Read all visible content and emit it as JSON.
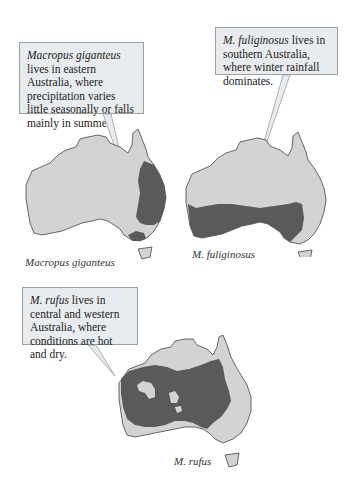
{
  "panels": [
    {
      "species": "Macropus giganteus",
      "callout_species": "Macropus giganteus",
      "callout_text": " lives in eastern Australia, where precipitation varies little seasonally or falls mainly in summer.",
      "caption": "Macropus giganteus",
      "range_region": "eastern Australia"
    },
    {
      "species": "M. fuliginosus",
      "callout_species": "M. fuliginosus",
      "callout_text": " lives in southern Australia, where winter rainfall dominates.",
      "caption": "M. fuliginosus",
      "range_region": "southern Australia"
    },
    {
      "species": "M. rufus",
      "callout_species": "M. rufus",
      "callout_text": " lives in central and western Australia, where conditions are hot and dry.",
      "caption": "M. rufus",
      "range_region": "central and western Australia"
    }
  ],
  "colors": {
    "land": "#d3d3d3",
    "range": "#5a5a5a",
    "callout_bg": "#e9ecef",
    "callout_border": "#9aa0a6"
  }
}
